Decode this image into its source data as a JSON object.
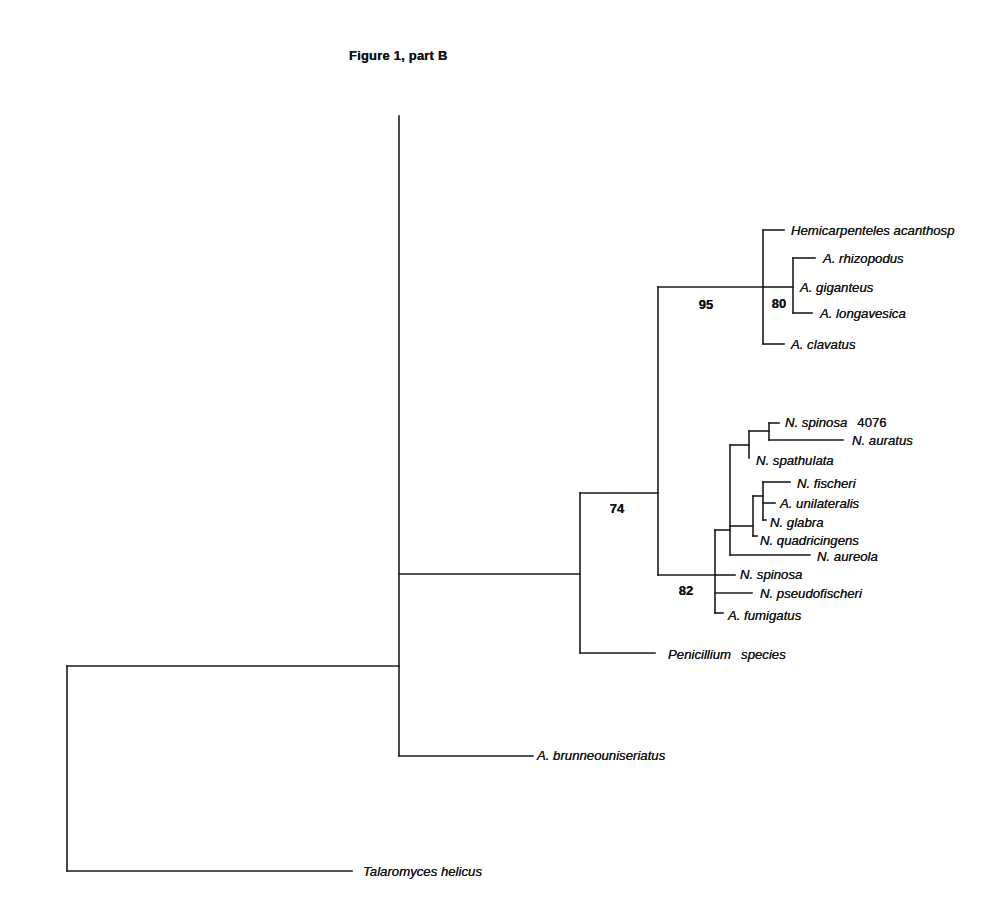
{
  "figure": {
    "title": "Figure 1, part B"
  },
  "tree": {
    "type": "phylogenetic-tree",
    "line_color": "#1b1b1b",
    "text_color": "#161616",
    "background_color": "#ffffff",
    "tips": [
      {
        "name": "Hemicarpenteles acanthosp",
        "x": 791,
        "y": 230
      },
      {
        "name": "A. rhizopodus",
        "x": 823,
        "y": 258
      },
      {
        "name": "A. giganteus",
        "x": 800,
        "y": 287
      },
      {
        "name": "A. longavesica",
        "x": 820,
        "y": 313
      },
      {
        "name": "A. clavatus",
        "x": 791,
        "y": 344
      },
      {
        "name": "N. spinosa",
        "suffix": "4076",
        "suffix_italic": false,
        "x": 785,
        "y": 422
      },
      {
        "name": "N. auratus",
        "x": 852,
        "y": 440
      },
      {
        "name": "N. spathulata",
        "x": 756,
        "y": 460
      },
      {
        "name": "N. fischeri",
        "x": 797,
        "y": 483
      },
      {
        "name": "A. unilateralis",
        "x": 780,
        "y": 503
      },
      {
        "name": "N. glabra",
        "x": 770,
        "y": 522
      },
      {
        "name": "N. quadricingens",
        "x": 760,
        "y": 540
      },
      {
        "name": "N. aureola",
        "x": 817,
        "y": 556
      },
      {
        "name": "N. spinosa",
        "x": 740,
        "y": 574
      },
      {
        "name": "N. pseudofischeri",
        "x": 760,
        "y": 593
      },
      {
        "name": "A. fumigatus",
        "x": 728,
        "y": 615
      },
      {
        "name": "Penicillium",
        "suffix": "species",
        "suffix_italic": true,
        "x": 668,
        "y": 654
      },
      {
        "name": "A. brunneouniseriatus",
        "x": 537,
        "y": 755
      },
      {
        "name": "Talaromyces helicus",
        "x": 363,
        "y": 871
      }
    ],
    "supports": [
      {
        "value": "95",
        "x": 706,
        "y": 304
      },
      {
        "value": "80",
        "x": 779,
        "y": 303
      },
      {
        "value": "74",
        "x": 617,
        "y": 508
      },
      {
        "value": "82",
        "x": 686,
        "y": 590
      }
    ],
    "segments": [
      [
        67,
        666,
        67,
        871
      ],
      [
        67,
        666,
        399,
        666
      ],
      [
        399,
        116,
        399,
        756
      ],
      [
        399,
        574,
        580,
        574
      ],
      [
        580,
        493,
        580,
        653
      ],
      [
        580,
        493,
        658,
        493
      ],
      [
        580,
        653,
        655,
        653
      ],
      [
        658,
        287,
        658,
        575
      ],
      [
        658,
        287,
        763,
        287
      ],
      [
        658,
        575,
        715,
        575
      ],
      [
        763,
        230,
        763,
        344
      ],
      [
        763,
        230,
        784,
        230
      ],
      [
        763,
        287,
        793,
        287
      ],
      [
        763,
        344,
        784,
        344
      ],
      [
        793,
        258,
        793,
        313
      ],
      [
        793,
        258,
        815,
        258
      ],
      [
        793,
        313,
        812,
        313
      ],
      [
        715,
        530,
        715,
        613
      ],
      [
        715,
        530,
        730,
        530
      ],
      [
        715,
        575,
        735,
        575
      ],
      [
        715,
        593,
        752,
        593
      ],
      [
        715,
        613,
        723,
        613
      ],
      [
        730,
        445,
        730,
        555
      ],
      [
        730,
        445,
        749,
        445
      ],
      [
        730,
        526,
        753,
        526
      ],
      [
        730,
        555,
        810,
        555
      ],
      [
        749,
        431,
        749,
        458
      ],
      [
        749,
        431,
        769,
        431
      ],
      [
        769,
        423,
        769,
        440
      ],
      [
        769,
        423,
        779,
        423
      ],
      [
        769,
        440,
        843,
        440
      ],
      [
        753,
        496,
        753,
        536
      ],
      [
        753,
        496,
        763,
        496
      ],
      [
        753,
        536,
        757,
        536
      ],
      [
        763,
        482,
        763,
        520
      ],
      [
        763,
        482,
        790,
        482
      ],
      [
        763,
        503,
        775,
        503
      ],
      [
        763,
        520,
        766,
        520
      ],
      [
        399,
        756,
        533,
        756
      ],
      [
        67,
        871,
        352,
        871
      ]
    ]
  }
}
